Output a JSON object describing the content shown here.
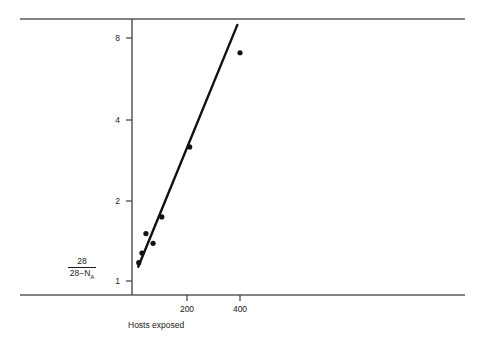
{
  "chart_data": {
    "type": "scatter",
    "title": "",
    "subtitle": "",
    "xlabel": "Hosts exposed",
    "ylabel_numerator": "28",
    "ylabel_denominator_lead": "28",
    "ylabel_denominator_minus": "−",
    "ylabel_denominator_var": "N",
    "ylabel_denominator_sub": "A",
    "ylabel_plain": "28 / (28 − N_A)",
    "xticks": [
      200,
      400
    ],
    "xtick_labels": [
      "200",
      "400"
    ],
    "yticks": [
      1,
      2,
      4,
      8
    ],
    "ytick_labels": [
      "1",
      "2",
      "4",
      "8"
    ],
    "yscale": "log",
    "xscale": "linear",
    "ylim": [
      0.93,
      9.6
    ],
    "xlim": [
      0,
      1255
    ],
    "grid": false,
    "legend": null,
    "points": [
      {
        "x": 18,
        "y": 1.17
      },
      {
        "x": 30,
        "y": 1.27
      },
      {
        "x": 45,
        "y": 1.5
      },
      {
        "x": 72,
        "y": 1.38
      },
      {
        "x": 105,
        "y": 1.73
      },
      {
        "x": 210,
        "y": 3.15
      },
      {
        "x": 400,
        "y": 7.05
      }
    ],
    "fit_line": {
      "label": "fitted regression line",
      "x_start": 16,
      "y_start": 1.13,
      "x_end": 390,
      "y_end": 8.95
    },
    "colors": {
      "data": "#111111",
      "line": "#111111",
      "axis": "#3f3f3f",
      "rule": "#5a5a5a",
      "text": "#1a1a1a",
      "background": "#ffffff"
    }
  },
  "geometry": {
    "rule_left": 20,
    "rule_right": 465,
    "rule_top_y": 19,
    "rule_bottom_y": 295,
    "yaxis_x": 132,
    "yaxis_top": 19,
    "yaxis_bottom": 295,
    "ytick_px": {
      "1": 281,
      "2": 201,
      "4": 120,
      "8": 38
    },
    "xtick_px": {
      "200": 187,
      "400": 240
    },
    "point_radius": 2.6
  }
}
